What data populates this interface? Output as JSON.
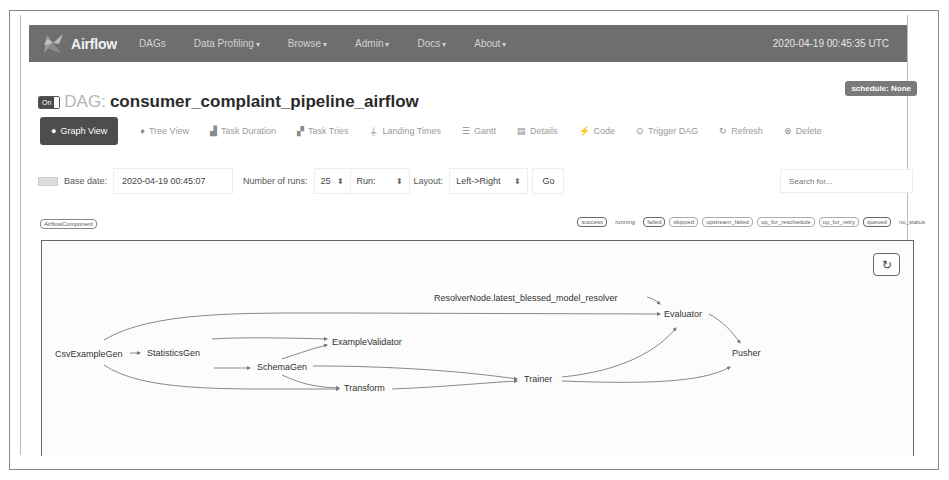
{
  "navbar": {
    "brand": "Airflow",
    "items": [
      {
        "label": "DAGs",
        "dropdown": false
      },
      {
        "label": "Data Profiling",
        "dropdown": true
      },
      {
        "label": "Browse",
        "dropdown": true
      },
      {
        "label": "Admin",
        "dropdown": true
      },
      {
        "label": "Docs",
        "dropdown": true
      },
      {
        "label": "About",
        "dropdown": true
      }
    ],
    "caret": "▾",
    "clock": "2020-04-19 00:45:35 UTC"
  },
  "dag": {
    "toggle_label": "On",
    "prefix": "DAG:",
    "name": "consumer_complaint_pipeline_airflow",
    "schedule_badge": "schedule: None"
  },
  "tabs": [
    {
      "label": "Graph View",
      "icon": "●",
      "active": true
    },
    {
      "label": "Tree View",
      "icon": "♦"
    },
    {
      "label": "Task Duration",
      "icon": "▟"
    },
    {
      "label": "Task Tries",
      "icon": "▞"
    },
    {
      "label": "Landing Times",
      "icon": "⏚"
    },
    {
      "label": "Gantt",
      "icon": "☰"
    },
    {
      "label": "Details",
      "icon": "▤"
    },
    {
      "label": "Code",
      "icon": "⚡"
    },
    {
      "label": "Trigger DAG",
      "icon": "⊙"
    },
    {
      "label": "Refresh",
      "icon": "↻"
    },
    {
      "label": "Delete",
      "icon": "⊗"
    }
  ],
  "controls": {
    "base_date_label": "Base date:",
    "base_date_value": "2020-04-19 00:45:07",
    "num_runs_label": "Number of runs:",
    "num_runs_value": "25",
    "run_label": "Run:",
    "run_value": "",
    "layout_label": "Layout:",
    "layout_value": "Left->Right",
    "spinner": "⬍",
    "go_label": "Go",
    "search_placeholder": "Search for..."
  },
  "legend": {
    "component_tag": "AirflowComponent",
    "states": [
      {
        "label": "success",
        "style": "dark"
      },
      {
        "label": "running",
        "style": "plain"
      },
      {
        "label": "failed",
        "style": "dark"
      },
      {
        "label": "skipped",
        "style": "outlined"
      },
      {
        "label": "upstream_failed",
        "style": "outlined"
      },
      {
        "label": "up_for_reschedule",
        "style": "outlined"
      },
      {
        "label": "up_for_retry",
        "style": "outlined"
      },
      {
        "label": "queued",
        "style": "dark"
      },
      {
        "label": "no_status",
        "style": "plain"
      }
    ]
  },
  "graph": {
    "refresh_icon": "↻",
    "nodes": [
      {
        "id": "csv",
        "label": "CsvExampleGen",
        "x": 13,
        "y": 108
      },
      {
        "id": "stats",
        "label": "StatisticsGen",
        "x": 123,
        "y": 107
      },
      {
        "id": "validator",
        "label": "ExampleValidator",
        "x": 290,
        "y": 97
      },
      {
        "id": "schema",
        "label": "SchemaGen",
        "x": 223,
        "y": 123
      },
      {
        "id": "transform",
        "label": "Transform",
        "x": 302,
        "y": 140
      },
      {
        "id": "trainer",
        "label": "Trainer",
        "x": 480,
        "y": 133
      },
      {
        "id": "resolver",
        "label": "ResolverNode.latest_blessed_model_resolver",
        "x": 393,
        "y": 52
      },
      {
        "id": "evaluator",
        "label": "Evaluator",
        "x": 623,
        "y": 70
      },
      {
        "id": "pusher",
        "label": "Pusher",
        "x": 690,
        "y": 107
      }
    ]
  }
}
